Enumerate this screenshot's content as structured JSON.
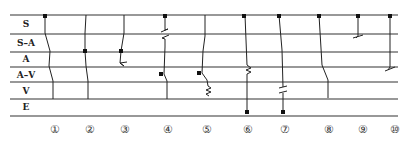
{
  "diagram": {
    "row_labels": [
      "S",
      "S–A",
      "A",
      "A–V",
      "V",
      "E"
    ],
    "row_lines_y": [
      15,
      34,
      52,
      67,
      82,
      99,
      116
    ],
    "line_x_start": 10,
    "line_x_end": 398,
    "column_numbers": [
      "①",
      "②",
      "③",
      "④",
      "⑤",
      "⑥",
      "⑦",
      "⑧",
      "⑨",
      "⑩"
    ],
    "column_number_x": [
      55,
      90,
      125,
      168,
      207,
      248,
      285,
      329,
      363,
      395
    ],
    "column_number_y": 129,
    "columns": [
      {
        "id": 1,
        "path": "M45 15 L45 33 L50 51 L49 66 L53 81 L53 99",
        "dots": [
          [
            45,
            16
          ]
        ],
        "marks": []
      },
      {
        "id": 2,
        "path": "M86 15 L85 33 L85 51 L86 66 L88 81 L88 99",
        "dots": [
          [
            85,
            51
          ]
        ],
        "marks": []
      },
      {
        "id": 3,
        "path": "M124 15 L124 33 L121 51 L120 63 L124 66",
        "dots": [
          [
            121,
            51
          ]
        ],
        "marks": [
          "M120 63 L127 62 M124 66 L120 63"
        ]
      },
      {
        "id": 4,
        "path": "M165 15 L165 30 M165 39 L165 47 L164 74 L167 81 L167 99",
        "dots": [
          [
            165,
            16
          ],
          [
            161,
            74
          ]
        ],
        "marks": [
          "M161 32 L168 29 M162 38 L169 35 M165 30 L168 29 M162 38 L165 39"
        ]
      },
      {
        "id": 5,
        "path": "M205 15 L205 36 L203 51 L202 73 L207 80 L208 86 L211 88 L206 90 L211 92 L206 94 L209 96",
        "dots": [
          [
            199,
            73
          ]
        ],
        "marks": []
      },
      {
        "id": 6,
        "path": "M245 15 L247 65 M247 74 L247 112",
        "dots": [
          [
            244,
            16
          ],
          [
            247,
            112
          ]
        ],
        "marks": [
          "M247 65 L251 68 L246 70 L251 72 L247 74"
        ]
      },
      {
        "id": 7,
        "path": "M279 15 L282 50 L283 87 M283 93 L283 112",
        "dots": [
          [
            279,
            16
          ],
          [
            283,
            112
          ]
        ],
        "marks": [
          "M279 88 L287 86 M279 93 L287 91"
        ]
      },
      {
        "id": 8,
        "path": "M319 15 L322 65 L328 80 L328 98",
        "dots": [
          [
            319,
            16
          ]
        ],
        "marks": []
      },
      {
        "id": 9,
        "path": "M358 15 L358 36",
        "dots": [
          [
            358,
            16
          ]
        ],
        "marks": [
          "M353 38 L363 35 M358 36 L356 38"
        ]
      },
      {
        "id": 10,
        "path": "M390 15 L390 67",
        "dots": [
          [
            390,
            16
          ]
        ],
        "marks": [
          "M385 71 L395 67 M390 67 L388 70"
        ]
      }
    ],
    "colors": {
      "line": "#222222",
      "background": "#ffffff"
    }
  }
}
